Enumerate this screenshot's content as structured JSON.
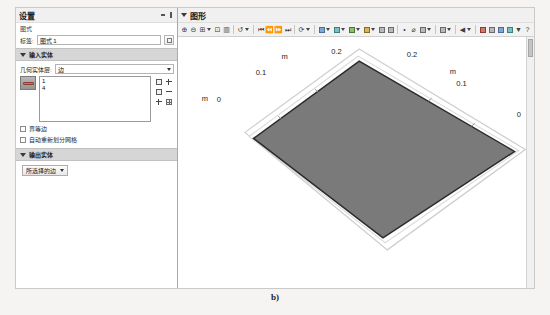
{
  "figure": {
    "caption": "b)"
  },
  "settings_panel": {
    "title": "设置",
    "subtitle": "图式",
    "titlebar_icons": [
      "collapse-icon",
      "menu-icon"
    ],
    "label_field": {
      "label": "标签:",
      "value": "图式 1",
      "placeholder": "",
      "toggle_button": "rename-button"
    },
    "input_section": {
      "header": "输入实体",
      "collapse_icon": "triangle-down-icon",
      "geometry_combo": {
        "label": "几何实体层:",
        "value": "边",
        "caret": "chevron-down-icon"
      },
      "selection": {
        "toggle_name": "active-selection-toggle",
        "items": [
          "1",
          "4"
        ],
        "side_icons": [
          "add-to-selection-icon",
          "zoom-selected-icon",
          "paste-selection-icon",
          "remove-from-selection-icon",
          "clear-selection-icon",
          "selection-list-icon"
        ]
      },
      "checkboxes": [
        {
          "label": "界等边",
          "checked": false
        },
        {
          "label": "自动重新划分网格",
          "checked": false
        }
      ]
    },
    "output_section": {
      "header": "输出实体",
      "collapse_icon": "triangle-down-icon",
      "dropdown": {
        "label": "所选择的边",
        "caret": "chevron-down-icon"
      }
    }
  },
  "graphics_panel": {
    "title": "图形",
    "titlebar_icons": [
      "collapse-icon"
    ],
    "toolbar": [
      {
        "name": "zoom-in-icon",
        "glyph": "⊕",
        "caret": false
      },
      {
        "name": "zoom-out-icon",
        "glyph": "⊖",
        "caret": false
      },
      {
        "name": "zoom-extents-icon",
        "glyph": "⊞",
        "caret": true
      },
      {
        "name": "zoom-box-icon",
        "glyph": "⊡",
        "caret": false
      },
      {
        "name": "transparency-icon",
        "glyph": "▥",
        "caret": false
      },
      {
        "sep": true
      },
      {
        "name": "rotate-icon",
        "glyph": "↺",
        "caret": true
      },
      {
        "sep": true
      },
      {
        "name": "go-first-icon",
        "glyph": "⏮",
        "caret": false
      },
      {
        "name": "go-prev-icon",
        "glyph": "⏪",
        "caret": false
      },
      {
        "name": "go-next-icon",
        "glyph": "⏩",
        "caret": false
      },
      {
        "name": "go-last-icon",
        "glyph": "⏭",
        "caret": false
      },
      {
        "sep": true
      },
      {
        "name": "refresh-icon",
        "glyph": "⟳",
        "caret": true
      },
      {
        "sep": true
      },
      {
        "name": "scene-light-icon",
        "swatch": "blue",
        "caret": true
      },
      {
        "name": "view-settings-icon",
        "swatch": "teal",
        "caret": true
      },
      {
        "name": "camera-icon",
        "swatch": "green",
        "caret": true
      },
      {
        "name": "grid-icon",
        "swatch": "gold",
        "caret": true
      },
      {
        "name": "axis-icon",
        "swatch": "gray",
        "caret": false
      },
      {
        "name": "orthographic-icon",
        "swatch": "gray",
        "caret": false
      },
      {
        "sep": true
      },
      {
        "name": "select-points-icon",
        "glyph": "•",
        "caret": false
      },
      {
        "name": "measure-icon",
        "glyph": "⌀",
        "caret": false
      },
      {
        "name": "clip-plane-icon",
        "swatch": "gray",
        "caret": true
      },
      {
        "sep": true
      },
      {
        "name": "print-icon",
        "swatch": "gray",
        "caret": true
      },
      {
        "sep": true
      },
      {
        "name": "arrow-left-icon",
        "glyph": "◀",
        "caret": true
      },
      {
        "sep": true
      },
      {
        "name": "sketch-icon",
        "swatch": "red",
        "caret": false
      },
      {
        "name": "image-snapshot-icon",
        "swatch": "gray",
        "caret": false
      },
      {
        "name": "copy-plot-icon",
        "swatch": "blue",
        "caret": false
      },
      {
        "name": "export-plot-icon",
        "swatch": "teal",
        "caret": false
      },
      {
        "name": "annotation-icon",
        "glyph": "▼",
        "caret": false
      },
      {
        "name": "help-icon",
        "glyph": "?",
        "caret": false
      }
    ],
    "chart_data": {
      "type": "scatter",
      "title": "",
      "subtitle": "",
      "xlabel": "m",
      "ylabel": "m",
      "zlabel": "m",
      "xlim": [
        0,
        0.25
      ],
      "ylim": [
        0,
        0.25
      ],
      "grid": false,
      "legend": null,
      "axes": [
        {
          "name": "top-left-axis",
          "unit": "m",
          "ticks": [
            "0",
            "0.1",
            "0.2"
          ]
        },
        {
          "name": "top-right-axis",
          "unit": "m",
          "ticks": [
            "0.2",
            "0.1",
            "0"
          ]
        }
      ],
      "annotations": [
        {
          "text": "0",
          "x": 28,
          "y": 62
        },
        {
          "text": "m",
          "x": 12,
          "y": 61
        },
        {
          "text": "0.1",
          "x": 78,
          "y": 35
        },
        {
          "text": "m",
          "x": 90,
          "y": 19
        },
        {
          "text": "0.2",
          "x": 140,
          "y": 15
        },
        {
          "text": "0.2",
          "x": 214,
          "y": 17
        },
        {
          "text": "m",
          "x": 253,
          "y": 34
        },
        {
          "text": "0.1",
          "x": 262,
          "y": 45
        },
        {
          "text": "0",
          "x": 318,
          "y": 77
        }
      ],
      "surface": {
        "name": "plate-surface",
        "fill": "#7a7a7a",
        "stroke": "#2b2b2b",
        "description": "flat square plate rendered in 3D perspective"
      }
    },
    "scrollbar": {
      "name": "vertical-scrollbar"
    }
  }
}
